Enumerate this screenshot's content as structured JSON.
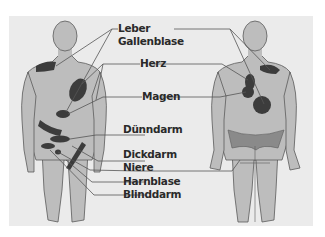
{
  "diagram": {
    "type": "anatomical referred-pain map",
    "views": [
      "front",
      "back"
    ],
    "colors": {
      "background": "#ffffff",
      "panel": "#ebebeb",
      "skin": "#bdbdbd",
      "outline": "#5a5a5a",
      "organ_area": "#3c3c3c",
      "back_hip_band": "#8a8a8a",
      "leader_line": "#555555",
      "label_text": "#2a2a2a"
    },
    "labels": [
      {
        "id": "leber",
        "text": "Leber"
      },
      {
        "id": "gallenblase",
        "text": "Gallenblase"
      },
      {
        "id": "herz",
        "text": "Herz"
      },
      {
        "id": "magen",
        "text": "Magen"
      },
      {
        "id": "duenndarm",
        "text": "Dünndarm"
      },
      {
        "id": "dickdarm",
        "text": "Dickdarm"
      },
      {
        "id": "niere",
        "text": "Niere"
      },
      {
        "id": "harnblase",
        "text": "Harnblase"
      },
      {
        "id": "blinddarm",
        "text": "Blinddarm"
      }
    ]
  }
}
